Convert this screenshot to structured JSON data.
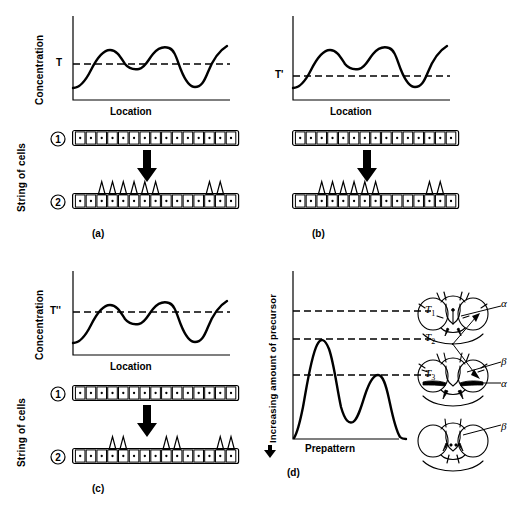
{
  "figure": {
    "axes": {
      "y_concentration": "Concentration",
      "x_location": "Location",
      "y_cells": "String of cells",
      "y_precursor": "Increasing amount of precursor",
      "x_prepattern": "Prepattern"
    },
    "row_numbers": {
      "before": "1",
      "after": "2"
    }
  },
  "panels": [
    {
      "id": "a",
      "tag": "(a)",
      "threshold_label": "T",
      "y_axis": "Concentration",
      "x_axis": "Location",
      "cell_count": 15,
      "bristle_cells": [
        2,
        3,
        4,
        5,
        6,
        7,
        12,
        13
      ],
      "threshold_level": 0.47
    },
    {
      "id": "b",
      "tag": "(b)",
      "threshold_label": "T'",
      "y_axis": "Concentration",
      "x_axis": "Location",
      "cell_count": 15,
      "bristle_cells": [
        2,
        3,
        4,
        5,
        6,
        7,
        12,
        13
      ],
      "threshold_level": 0.3
    },
    {
      "id": "c",
      "tag": "(c)",
      "threshold_label": "T''",
      "y_axis": "Concentration",
      "x_axis": "Location",
      "cell_count": 15,
      "bristle_cells": [
        3,
        4,
        8,
        9,
        13,
        14
      ],
      "threshold_level": 0.58
    }
  ],
  "panel_d": {
    "tag": "(d)",
    "y_axis": "Increasing amount of precursor",
    "x_axis": "Prepattern",
    "thresholds": [
      {
        "label": "T",
        "sub": "1",
        "level": 0.78
      },
      {
        "label": "T",
        "sub": "2",
        "level": 0.62
      },
      {
        "label": "T",
        "sub": "3",
        "level": 0.42
      }
    ],
    "flies": [
      {
        "name": "fly-head-top",
        "labels": [
          "α"
        ]
      },
      {
        "name": "fly-head-middle",
        "labels": [
          "β",
          "α"
        ]
      },
      {
        "name": "fly-head-bottom",
        "labels": [
          "β"
        ]
      }
    ],
    "chart_data": {
      "type": "line",
      "title": "",
      "xlabel": "Prepattern",
      "ylabel": "Increasing amount of precursor",
      "ylim": [
        0,
        1
      ],
      "grid": false,
      "legend": "none",
      "annotations": [
        "T1",
        "T2",
        "T3"
      ],
      "series": [
        {
          "name": "precursor-prepattern",
          "x": [
            0,
            5,
            12,
            20,
            26,
            30,
            34,
            40,
            48,
            55,
            62,
            68,
            74,
            80,
            86,
            92,
            100
          ],
          "y": [
            0.02,
            0.05,
            0.16,
            0.4,
            0.58,
            0.62,
            0.55,
            0.33,
            0.17,
            0.13,
            0.18,
            0.3,
            0.42,
            0.34,
            0.16,
            0.06,
            0.02
          ]
        }
      ],
      "threshold_lines": [
        {
          "name": "T1",
          "y": 0.78
        },
        {
          "name": "T2",
          "y": 0.62
        },
        {
          "name": "T3",
          "y": 0.42
        }
      ]
    }
  },
  "chart_data": [
    {
      "type": "line",
      "title": "(a)",
      "xlabel": "Location",
      "ylabel": "Concentration",
      "ylim": [
        0,
        1
      ],
      "grid": false,
      "legend": "none",
      "annotations": [
        "T"
      ],
      "series": [
        {
          "name": "concentration-a",
          "x": [
            0,
            6,
            14,
            22,
            30,
            38,
            46,
            54,
            62,
            70,
            78,
            86,
            94,
            100
          ],
          "y": [
            0.18,
            0.2,
            0.4,
            0.62,
            0.52,
            0.5,
            0.6,
            0.63,
            0.42,
            0.2,
            0.18,
            0.35,
            0.6,
            0.68
          ]
        }
      ],
      "threshold_lines": [
        {
          "name": "T",
          "y": 0.47
        }
      ]
    },
    {
      "type": "line",
      "title": "(b)",
      "xlabel": "Location",
      "ylabel": "Concentration",
      "ylim": [
        0,
        1
      ],
      "grid": false,
      "legend": "none",
      "annotations": [
        "T'"
      ],
      "series": [
        {
          "name": "concentration-b",
          "x": [
            0,
            6,
            14,
            22,
            30,
            38,
            46,
            54,
            62,
            70,
            78,
            86,
            94,
            100
          ],
          "y": [
            0.18,
            0.2,
            0.4,
            0.62,
            0.52,
            0.5,
            0.6,
            0.63,
            0.42,
            0.2,
            0.18,
            0.35,
            0.6,
            0.68
          ]
        }
      ],
      "threshold_lines": [
        {
          "name": "T'",
          "y": 0.3
        }
      ]
    },
    {
      "type": "line",
      "title": "(c)",
      "xlabel": "Location",
      "ylabel": "Concentration",
      "ylim": [
        0,
        1
      ],
      "grid": false,
      "legend": "none",
      "annotations": [
        "T''"
      ],
      "series": [
        {
          "name": "concentration-c",
          "x": [
            0,
            6,
            14,
            22,
            30,
            38,
            46,
            54,
            62,
            70,
            78,
            86,
            94,
            100
          ],
          "y": [
            0.18,
            0.2,
            0.4,
            0.62,
            0.52,
            0.5,
            0.6,
            0.63,
            0.42,
            0.2,
            0.18,
            0.35,
            0.6,
            0.68
          ]
        }
      ],
      "threshold_lines": [
        {
          "name": "T''",
          "y": 0.58
        }
      ]
    },
    {
      "type": "line",
      "title": "(d)",
      "xlabel": "Prepattern",
      "ylabel": "Increasing amount of precursor",
      "ylim": [
        0,
        1
      ],
      "grid": false,
      "legend": "none",
      "annotations": [
        "T1",
        "T2",
        "T3"
      ],
      "series": [
        {
          "name": "precursor-prepattern",
          "x": [
            0,
            5,
            12,
            20,
            26,
            30,
            34,
            40,
            48,
            55,
            62,
            68,
            74,
            80,
            86,
            92,
            100
          ],
          "y": [
            0.02,
            0.05,
            0.16,
            0.4,
            0.58,
            0.62,
            0.55,
            0.33,
            0.17,
            0.13,
            0.18,
            0.3,
            0.42,
            0.34,
            0.16,
            0.06,
            0.02
          ]
        }
      ],
      "threshold_lines": [
        {
          "name": "T1",
          "y": 0.78
        },
        {
          "name": "T2",
          "y": 0.62
        },
        {
          "name": "T3",
          "y": 0.42
        }
      ]
    }
  ]
}
